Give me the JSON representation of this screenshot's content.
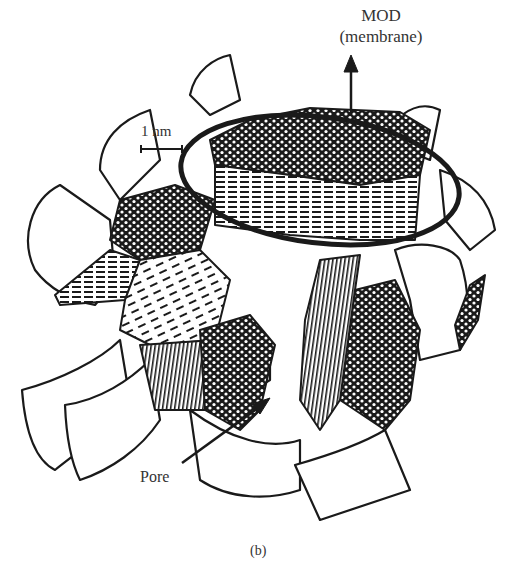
{
  "figure": {
    "panel_label": "(b)",
    "labels": {
      "mod": "MOD",
      "membrane": "(membrane)",
      "scale_bar": "1 nm",
      "pore": "Pore"
    }
  },
  "colors": {
    "ink": "#1a1a1a",
    "background": "#ffffff",
    "text": "#333333"
  }
}
